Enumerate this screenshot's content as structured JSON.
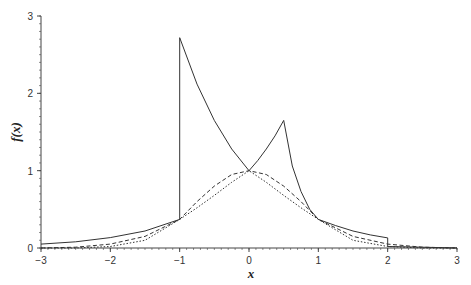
{
  "chart_data": {
    "type": "line",
    "title": "",
    "xlabel": "x",
    "ylabel": "f(x)",
    "xlim": [
      -3,
      3
    ],
    "ylim": [
      0,
      3
    ],
    "x_ticks": [
      -3,
      -2,
      -1,
      0,
      1,
      2,
      3
    ],
    "y_ticks": [
      0,
      1,
      2,
      3
    ],
    "grid": false,
    "legend": null,
    "series": [
      {
        "name": "solid",
        "style": "solid",
        "x": [
          -3,
          -2.5,
          -2,
          -1.5,
          -1,
          -1,
          -0.75,
          -0.5,
          -0.25,
          0,
          0.125,
          0.25,
          0.375,
          0.5,
          0.625,
          0.75,
          0.875,
          1,
          1.25,
          1.5,
          1.75,
          2,
          2,
          2.5,
          3
        ],
        "values": [
          0.05,
          0.08,
          0.135,
          0.22,
          0.37,
          2.72,
          2.12,
          1.65,
          1.28,
          1.0,
          1.13,
          1.28,
          1.45,
          1.65,
          1.06,
          0.73,
          0.5,
          0.37,
          0.29,
          0.22,
          0.17,
          0.13,
          0.02,
          0.01,
          0.0
        ]
      },
      {
        "name": "dashed",
        "style": "dashed",
        "x": [
          -3,
          -2.5,
          -2,
          -1.5,
          -1,
          -0.75,
          -0.5,
          -0.25,
          0,
          0.25,
          0.5,
          0.75,
          1,
          1.5,
          2,
          2.5,
          3
        ],
        "values": [
          0.0,
          0.01,
          0.05,
          0.15,
          0.37,
          0.6,
          0.8,
          0.95,
          1.0,
          0.95,
          0.8,
          0.6,
          0.37,
          0.15,
          0.05,
          0.01,
          0.0
        ]
      },
      {
        "name": "dotted",
        "style": "dotted",
        "x": [
          -3,
          -2.5,
          -2,
          -1.5,
          -1,
          -0.75,
          -0.5,
          -0.25,
          0,
          0.25,
          0.5,
          0.75,
          1,
          1.5,
          2,
          2.5,
          3
        ],
        "values": [
          0.0,
          0.0,
          0.02,
          0.1,
          0.37,
          0.52,
          0.68,
          0.85,
          1.0,
          0.85,
          0.68,
          0.52,
          0.37,
          0.1,
          0.02,
          0.0,
          0.0
        ]
      }
    ]
  },
  "colors": {
    "line": "#333333",
    "axis": "#444444",
    "background": "#ffffff"
  }
}
